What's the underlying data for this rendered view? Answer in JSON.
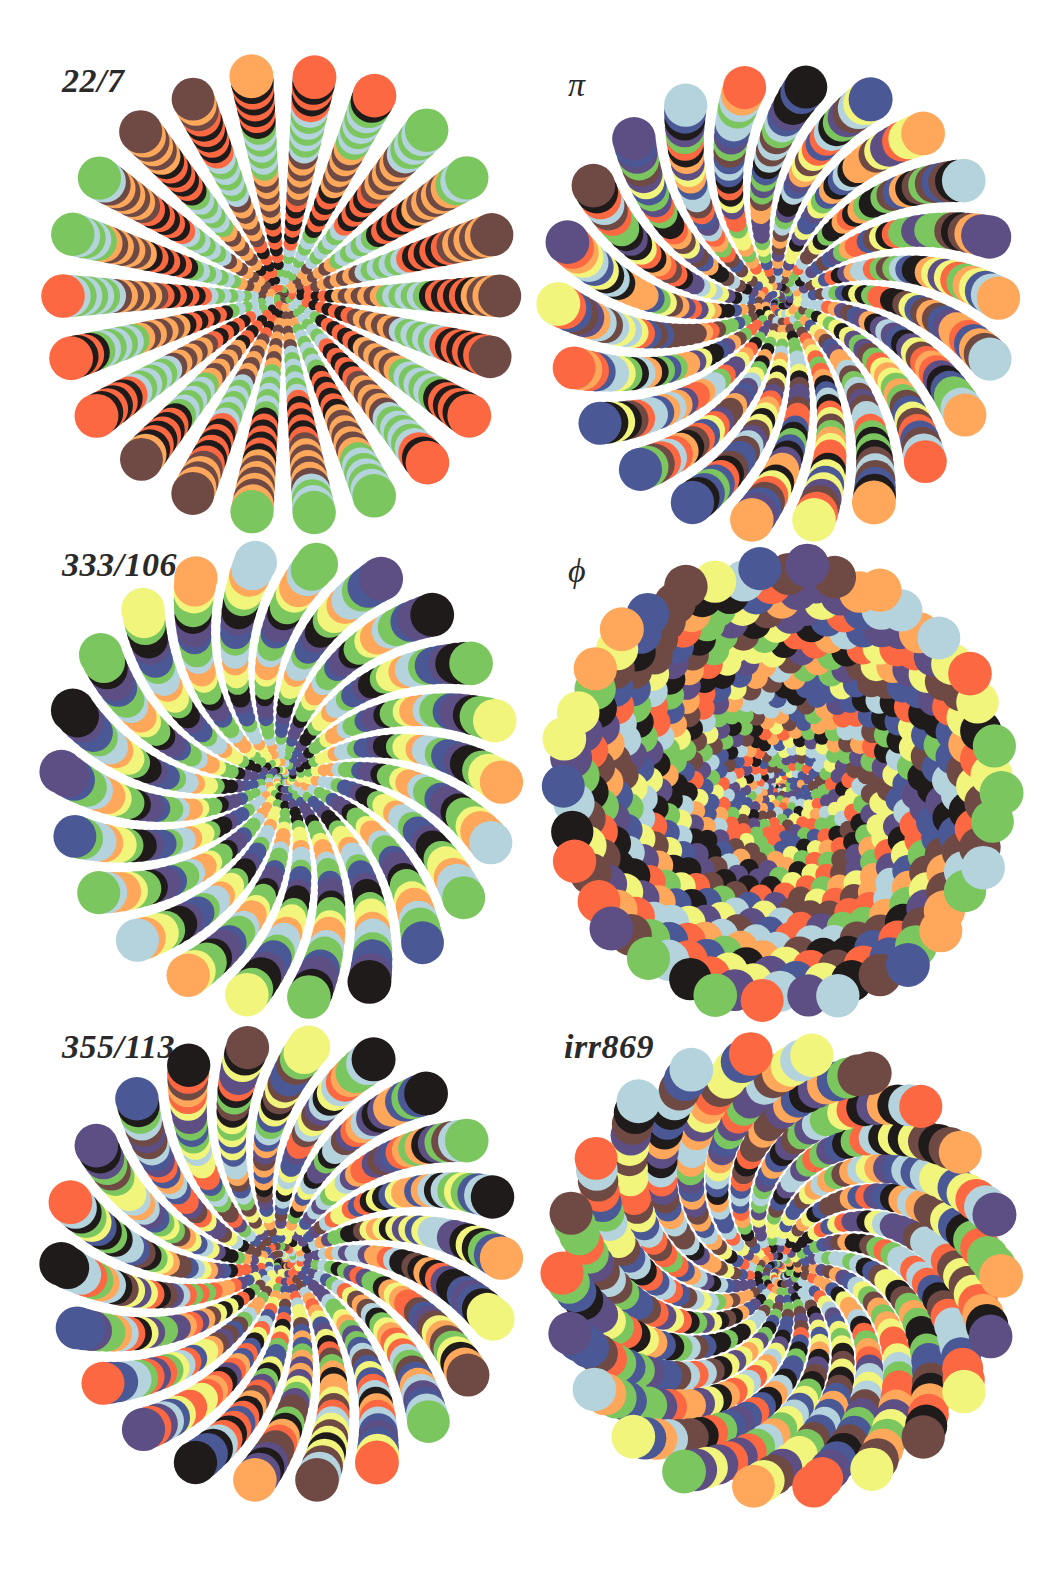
{
  "figure": {
    "palette": {
      "black": "#1f1b1b",
      "brown": "#6f4a45",
      "lightblue": "#b4d3dc",
      "green": "#7cc65f",
      "orange": "#ffa75a",
      "redorange": "#fb6841",
      "purple": "#5d4e84",
      "navy": "#4b5896",
      "yellow": "#f1f57c"
    },
    "panels": [
      {
        "label": "22/7",
        "constant": 3.142857142857143,
        "label_pos": [
          62,
          62
        ],
        "center": [
          283,
          296
        ],
        "radius": 222,
        "colors": [
          "black",
          "brown",
          "green",
          "redorange",
          "orange",
          "lightblue"
        ]
      },
      {
        "label": "π",
        "constant": 3.141592653589793,
        "label_pos": [
          568,
          66
        ],
        "center": [
          780,
          302
        ],
        "radius": 222,
        "colors": [
          "black",
          "brown",
          "purple",
          "navy",
          "lightblue",
          "green",
          "yellow",
          "orange",
          "redorange"
        ]
      },
      {
        "label": "333/106",
        "constant": 3.141509433962264,
        "label_pos": [
          62,
          546
        ],
        "center": [
          283,
          778
        ],
        "radius": 222,
        "colors": [
          "black",
          "purple",
          "navy",
          "green",
          "lightblue",
          "orange",
          "yellow",
          "green"
        ]
      },
      {
        "label": "ϕ",
        "constant": 1.618033988749895,
        "label_pos": [
          568,
          552
        ],
        "center": [
          780,
          785
        ],
        "radius": 222,
        "colors": [
          "black",
          "brown",
          "purple",
          "navy",
          "lightblue",
          "green",
          "yellow",
          "orange",
          "redorange"
        ]
      },
      {
        "label": "355/113",
        "constant": 3.1415929203539825,
        "label_pos": [
          62,
          1028
        ],
        "center": [
          283,
          1262
        ],
        "radius": 222,
        "colors": [
          "black",
          "brown",
          "purple",
          "navy",
          "lightblue",
          "green",
          "yellow",
          "orange",
          "redorange"
        ]
      },
      {
        "label": "irr869",
        "constant": 3.1396,
        "label_pos": [
          564,
          1028
        ],
        "center": [
          780,
          1272
        ],
        "radius": 222,
        "colors": [
          "black",
          "brown",
          "purple",
          "navy",
          "lightblue",
          "green",
          "yellow",
          "orange",
          "redorange"
        ]
      }
    ]
  }
}
